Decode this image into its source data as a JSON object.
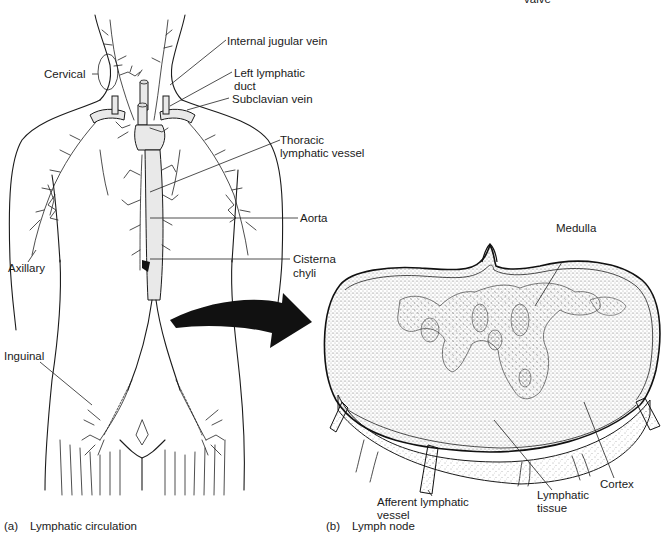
{
  "figure": {
    "top_fragment": "valve",
    "panel_a": {
      "tag": "(a)",
      "caption": "Lymphatic circulation",
      "labels": {
        "cervical": "Cervical",
        "axillary": "Axillary",
        "inguinal": "Inguinal",
        "internal_jugular_vein": "Internal jugular vein",
        "left_lymphatic_duct_1": "Left lymphatic",
        "left_lymphatic_duct_2": "duct",
        "subclavian_vein": "Subclavian vein",
        "thoracic_1": "Thoracic",
        "thoracic_2": "lymphatic vessel",
        "aorta": "Aorta",
        "cisterna_1": "Cisterna",
        "cisterna_2": "chyli"
      }
    },
    "panel_b": {
      "tag": "(b)",
      "caption": "Lymph node",
      "labels": {
        "medulla": "Medulla",
        "afferent_1": "Afferent lymphatic",
        "afferent_2": "vessel",
        "lymphatic_tissue_1": "Lymphatic",
        "lymphatic_tissue_2": "tissue",
        "cortex": "Cortex"
      }
    },
    "colors": {
      "ink": "#1b1b1b",
      "arrow": "#111111",
      "stipple": "#6a6a6a",
      "aorta_leader_tint": "#3a9a3a",
      "cisterna_leader_tint": "#8a3aa8"
    }
  }
}
